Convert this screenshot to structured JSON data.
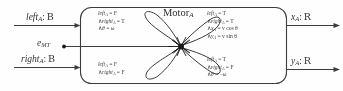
{
  "figure": {
    "kind": "hybrid-automaton-block-diagram",
    "block_title": "Motor",
    "block_title_sub": "A"
  },
  "inputs": [
    {
      "id": "left",
      "name": "left",
      "sub": "A",
      "colon": ":",
      "type": "ᴭ",
      "type_display": "B"
    },
    {
      "id": "energy",
      "name": "e",
      "sub": "MT",
      "colon": "",
      "type": "",
      "type_display": ""
    },
    {
      "id": "right",
      "name": "right",
      "sub": "A",
      "colon": ":",
      "type": "ᴭ",
      "type_display": "B"
    }
  ],
  "outputs": [
    {
      "id": "x",
      "name": "x",
      "sub": "A",
      "colon": ":",
      "type_display": "R"
    },
    {
      "id": "y",
      "name": "y",
      "sub": "A",
      "colon": ":",
      "type_display": "R"
    }
  ],
  "transitions": [
    {
      "id": "turn-left",
      "position": "top-left",
      "lines": [
        {
          "conj": "",
          "var": "left",
          "sub": "A",
          "op": "=",
          "val": "F"
        },
        {
          "conj": "∧",
          "var": "right",
          "sub": "A",
          "op": "=",
          "val": "T"
        },
        {
          "conj": "∧",
          "var": "θ",
          "dot": true,
          "sub": "",
          "op": "=",
          "val": "ω"
        }
      ]
    },
    {
      "id": "drive-forward",
      "position": "top-right",
      "lines": [
        {
          "conj": "",
          "var": "left",
          "sub": "A",
          "op": "=",
          "val": "T"
        },
        {
          "conj": "∧",
          "var": "right",
          "sub": "A",
          "op": "=",
          "val": "T"
        },
        {
          "conj": "∧",
          "var": "x",
          "dot": true,
          "sub": "A",
          "op": "=",
          "val": "v cos θ"
        },
        {
          "conj": "∧",
          "var": "y",
          "dot": true,
          "sub": "A",
          "op": "=",
          "val": "v sin θ"
        }
      ]
    },
    {
      "id": "stopped",
      "position": "bottom-left",
      "lines": [
        {
          "conj": "",
          "var": "left",
          "sub": "A",
          "op": "=",
          "val": "F"
        },
        {
          "conj": "∧",
          "var": "right",
          "sub": "A",
          "op": "=",
          "val": "F"
        }
      ]
    },
    {
      "id": "turn-right",
      "position": "bottom-right",
      "lines": [
        {
          "conj": "",
          "var": "left",
          "sub": "A",
          "op": "=",
          "val": "T"
        },
        {
          "conj": "∧",
          "var": "right",
          "sub": "A",
          "op": "=",
          "val": "F"
        },
        {
          "conj": "∧",
          "var": "θ",
          "dot": true,
          "sub": "",
          "op": "=",
          "val": "−ω"
        }
      ]
    }
  ],
  "colors": {
    "stroke": "#3c3c3c",
    "text": "#3a3a3a",
    "background": "#fefefe",
    "node": "#1a1a1a"
  }
}
